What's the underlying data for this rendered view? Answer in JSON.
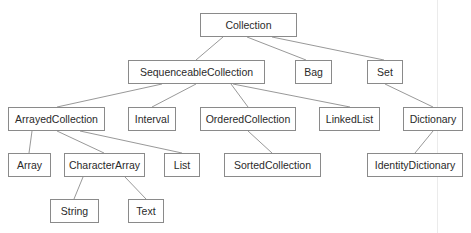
{
  "diagram": {
    "nodes": {
      "collection": {
        "label": "Collection",
        "x": 200,
        "y": 13,
        "w": 97,
        "h": 24
      },
      "sequenceable": {
        "label": "SequenceableCollection",
        "x": 128,
        "y": 60,
        "w": 137,
        "h": 24
      },
      "bag": {
        "label": "Bag",
        "x": 295,
        "y": 60,
        "w": 37,
        "h": 24
      },
      "set": {
        "label": "Set",
        "x": 367,
        "y": 60,
        "w": 36,
        "h": 24
      },
      "arrayed": {
        "label": "ArrayedCollection",
        "x": 8,
        "y": 107,
        "w": 97,
        "h": 24
      },
      "interval": {
        "label": "Interval",
        "x": 128,
        "y": 107,
        "w": 48,
        "h": 24
      },
      "ordered": {
        "label": "OrderedCollection",
        "x": 200,
        "y": 107,
        "w": 96,
        "h": 24
      },
      "linkedlist": {
        "label": "LinkedList",
        "x": 319,
        "y": 107,
        "w": 61,
        "h": 24
      },
      "dictionary": {
        "label": "Dictionary",
        "x": 403,
        "y": 107,
        "w": 60,
        "h": 24
      },
      "array": {
        "label": "Array",
        "x": 8,
        "y": 153,
        "w": 43,
        "h": 24
      },
      "characterarray": {
        "label": "CharacterArray",
        "x": 64,
        "y": 153,
        "w": 81,
        "h": 24
      },
      "list": {
        "label": "List",
        "x": 164,
        "y": 153,
        "w": 36,
        "h": 24
      },
      "sorted": {
        "label": "SortedCollection",
        "x": 224,
        "y": 153,
        "w": 97,
        "h": 24
      },
      "identitydictionary": {
        "label": "IdentityDictionary",
        "x": 367,
        "y": 153,
        "w": 96,
        "h": 24
      },
      "string": {
        "label": "String",
        "x": 50,
        "y": 199,
        "w": 49,
        "h": 24
      },
      "text": {
        "label": "Text",
        "x": 128,
        "y": 199,
        "w": 36,
        "h": 24
      }
    },
    "edges": [
      {
        "from": "collection",
        "to": "sequenceable",
        "x1": 223,
        "y1": 37,
        "x2": 196,
        "y2": 60
      },
      {
        "from": "collection",
        "to": "bag",
        "x1": 247,
        "y1": 37,
        "x2": 306,
        "y2": 60
      },
      {
        "from": "collection",
        "to": "set",
        "x1": 272,
        "y1": 37,
        "x2": 384,
        "y2": 60
      },
      {
        "from": "sequenceable",
        "to": "arrayed",
        "x1": 162,
        "y1": 84,
        "x2": 57,
        "y2": 107
      },
      {
        "from": "sequenceable",
        "to": "interval",
        "x1": 196,
        "y1": 84,
        "x2": 152,
        "y2": 107
      },
      {
        "from": "sequenceable",
        "to": "ordered",
        "x1": 231,
        "y1": 84,
        "x2": 248,
        "y2": 107
      },
      {
        "from": "sequenceable",
        "to": "linkedlist",
        "x1": 233,
        "y1": 84,
        "x2": 350,
        "y2": 107
      },
      {
        "from": "set",
        "to": "dictionary",
        "x1": 385,
        "y1": 84,
        "x2": 433,
        "y2": 107
      },
      {
        "from": "arrayed",
        "to": "array",
        "x1": 32,
        "y1": 131,
        "x2": 29,
        "y2": 153
      },
      {
        "from": "arrayed",
        "to": "characterarray",
        "x1": 57,
        "y1": 131,
        "x2": 104,
        "y2": 153
      },
      {
        "from": "arrayed",
        "to": "list",
        "x1": 80,
        "y1": 131,
        "x2": 182,
        "y2": 153
      },
      {
        "from": "ordered",
        "to": "sorted",
        "x1": 248,
        "y1": 131,
        "x2": 272,
        "y2": 153
      },
      {
        "from": "dictionary",
        "to": "identitydictionary",
        "x1": 433,
        "y1": 131,
        "x2": 415,
        "y2": 153
      },
      {
        "from": "characterarray",
        "to": "string",
        "x1": 83,
        "y1": 177,
        "x2": 74,
        "y2": 199
      },
      {
        "from": "characterarray",
        "to": "text",
        "x1": 125,
        "y1": 177,
        "x2": 146,
        "y2": 199
      }
    ]
  }
}
